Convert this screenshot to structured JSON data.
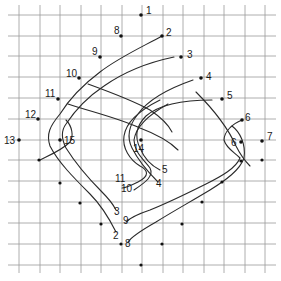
{
  "diagram": {
    "type": "string-figure-grid",
    "grid": {
      "x_lines": [
        19,
        40,
        60,
        81,
        101,
        122,
        142,
        163,
        183,
        204,
        224,
        245,
        265
      ],
      "y_lines": [
        15,
        36,
        56,
        77,
        98,
        119,
        140,
        160,
        181,
        202,
        223,
        244,
        265
      ],
      "color": "#9a9a9a"
    },
    "points": [
      {
        "id": "p1",
        "label": "1",
        "x": 141,
        "y": 15,
        "lx": 146,
        "ly": 14
      },
      {
        "id": "p2",
        "label": "2",
        "x": 162,
        "y": 36,
        "lx": 166,
        "ly": 36
      },
      {
        "id": "p3",
        "label": "3",
        "x": 181,
        "y": 57,
        "lx": 187,
        "ly": 58
      },
      {
        "id": "p4",
        "label": "4",
        "x": 201,
        "y": 78,
        "lx": 206,
        "ly": 80
      },
      {
        "id": "p5",
        "label": "5",
        "x": 222,
        "y": 99,
        "lx": 227,
        "ly": 99
      },
      {
        "id": "p6",
        "label": "6",
        "x": 242,
        "y": 120,
        "lx": 245,
        "ly": 121
      },
      {
        "id": "p7",
        "label": "7",
        "x": 262,
        "y": 141,
        "lx": 267,
        "ly": 140
      },
      {
        "id": "p8",
        "label": "8",
        "x": 121,
        "y": 36,
        "lx": 114,
        "ly": 34
      },
      {
        "id": "p9",
        "label": "9",
        "x": 100,
        "y": 57,
        "lx": 92,
        "ly": 55
      },
      {
        "id": "p10",
        "label": "10",
        "x": 79,
        "y": 78,
        "lx": 66,
        "ly": 77
      },
      {
        "id": "p11",
        "label": "11",
        "x": 58,
        "y": 99,
        "lx": 45,
        "ly": 97
      },
      {
        "id": "p12",
        "label": "12",
        "x": 38,
        "y": 119,
        "lx": 25,
        "ly": 118
      },
      {
        "id": "p13",
        "label": "13",
        "x": 19,
        "y": 140,
        "lx": 4,
        "ly": 144
      },
      {
        "id": "p15",
        "label": "15",
        "x": 60,
        "y": 140,
        "lx": 64,
        "ly": 144
      },
      {
        "id": "p14",
        "label": "14",
        "x": 141,
        "y": 140,
        "lx": 133,
        "ly": 152
      },
      {
        "id": "p16",
        "label": "6",
        "x": 241,
        "y": 142,
        "lx": 231,
        "ly": 146
      }
    ],
    "extra_dots": [
      [
        39,
        160
      ],
      [
        60,
        183
      ],
      [
        80,
        203
      ],
      [
        101,
        224
      ],
      [
        121,
        244
      ],
      [
        141,
        265
      ],
      [
        162,
        244
      ],
      [
        182,
        224
      ],
      [
        202,
        202
      ],
      [
        222,
        182
      ],
      [
        241,
        161
      ],
      [
        262,
        160
      ]
    ],
    "strand_labels": [
      {
        "label": "11",
        "x": 115,
        "y": 182
      },
      {
        "label": "10",
        "x": 121,
        "y": 192
      },
      {
        "label": "5",
        "x": 162,
        "y": 173
      },
      {
        "label": "4",
        "x": 156,
        "y": 187
      },
      {
        "label": "3",
        "x": 114,
        "y": 215
      },
      {
        "label": "9",
        "x": 123,
        "y": 224
      },
      {
        "label": "2",
        "x": 113,
        "y": 239
      },
      {
        "label": "8",
        "x": 125,
        "y": 247
      }
    ]
  }
}
